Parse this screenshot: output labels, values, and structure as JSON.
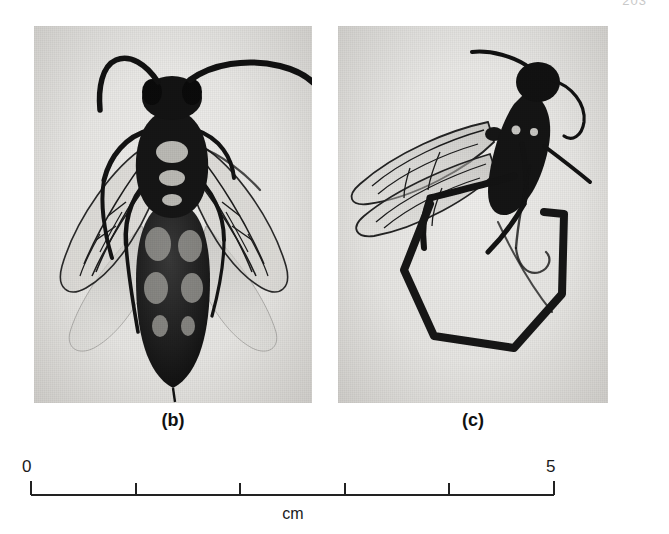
{
  "figure": {
    "page_number": "203",
    "panels": [
      {
        "id": "b",
        "caption": "(b)",
        "subject": "dorsal view of adult sawfly specimen with spread wings and long antennae",
        "background_color": "#e8e7e4",
        "specimen_color": "#171717"
      },
      {
        "id": "c",
        "caption": "(c)",
        "subject": "lateral view of adult sawfly specimen with folded wings beside a dark hexagonal wire loop",
        "background_color": "#e8e7e4",
        "specimen_color": "#171717"
      }
    ]
  },
  "scale": {
    "unit_label": "cm",
    "start_label": "0",
    "end_label": "5",
    "min": 0,
    "max": 5,
    "tick_values": [
      0,
      1,
      2,
      3,
      4,
      5
    ],
    "tick_count": 6,
    "line_color": "#222222",
    "px_per_unit": 104.6
  }
}
